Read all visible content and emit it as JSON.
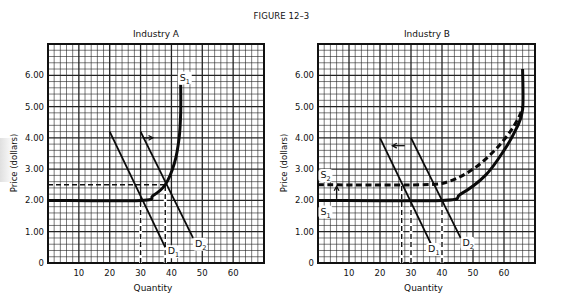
{
  "figure": {
    "title": "FIGURE 12–3"
  },
  "chart_data": [
    {
      "type": "line",
      "title": "Industry A",
      "xlabel": "Quantity",
      "ylabel": "Price (dollars)",
      "xlim": [
        0,
        70
      ],
      "ylim": [
        0,
        7
      ],
      "x_ticks": [
        "10",
        "20",
        "30",
        "40",
        "50",
        "60"
      ],
      "y_ticks": [
        "0",
        "1.00",
        "2.00",
        "3.00",
        "4.00",
        "5.00",
        "6.00"
      ],
      "grid": true,
      "series": [
        {
          "name": "S1",
          "style": "solid-thick",
          "points": [
            [
              0,
              2.0
            ],
            [
              30,
              2.0
            ],
            [
              34,
              2.15
            ],
            [
              38,
              2.5
            ],
            [
              41,
              3.2
            ],
            [
              42.5,
              4.0
            ],
            [
              43,
              4.8
            ],
            [
              43,
              5.7
            ]
          ]
        },
        {
          "name": "D1",
          "style": "solid",
          "points": [
            [
              20,
              4.2
            ],
            [
              38,
              0.5
            ]
          ]
        },
        {
          "name": "D2",
          "style": "solid",
          "points": [
            [
              30,
              4.2
            ],
            [
              47,
              0.8
            ]
          ]
        }
      ],
      "annotations": [
        {
          "type": "dashed-h",
          "y": 2.5,
          "x_from": 0,
          "x_to": 38
        },
        {
          "type": "dashed-v",
          "x": 30,
          "y_from": 0,
          "y_to": 2.0
        },
        {
          "type": "dashed-v",
          "x": 38,
          "y_from": 0,
          "y_to": 2.5
        },
        {
          "type": "arrow",
          "from": [
            31,
            4.0
          ],
          "to": [
            34,
            4.0
          ],
          "direction": "right"
        }
      ],
      "labels": {
        "s1": "S",
        "s1_sub": "1",
        "d1": "D",
        "d1_sub": "1",
        "d2": "D",
        "d2_sub": "2"
      }
    },
    {
      "type": "line",
      "title": "Industry B",
      "xlabel": "Quantity",
      "ylabel": "Price (dollars)",
      "xlim": [
        0,
        70
      ],
      "ylim": [
        0,
        7
      ],
      "x_ticks": [
        "10",
        "20",
        "30",
        "40",
        "50",
        "60"
      ],
      "y_ticks": [
        "0",
        "1.00",
        "2.00",
        "3.00",
        "4.00",
        "5.00",
        "6.00"
      ],
      "grid": true,
      "series": [
        {
          "name": "S1",
          "style": "solid-thick",
          "points": [
            [
              0,
              2.0
            ],
            [
              40,
              2.0
            ],
            [
              46,
              2.2
            ],
            [
              54,
              2.8
            ],
            [
              60,
              3.6
            ],
            [
              64,
              4.3
            ],
            [
              66,
              4.9
            ],
            [
              66,
              6.2
            ]
          ]
        },
        {
          "name": "S2",
          "style": "dashed-thick",
          "points": [
            [
              0,
              2.5
            ],
            [
              33,
              2.5
            ],
            [
              42,
              2.6
            ],
            [
              50,
              3.0
            ],
            [
              57,
              3.6
            ],
            [
              62,
              4.2
            ],
            [
              65,
              4.7
            ],
            [
              66,
              5.0
            ]
          ]
        },
        {
          "name": "D1",
          "style": "solid",
          "points": [
            [
              20,
              4.0
            ],
            [
              37,
              0.5
            ]
          ]
        },
        {
          "name": "D2",
          "style": "solid",
          "points": [
            [
              30,
              4.0
            ],
            [
              46,
              0.8
            ]
          ]
        }
      ],
      "annotations": [
        {
          "type": "dashed-v",
          "x": 27,
          "y_from": 0,
          "y_to": 2.5
        },
        {
          "type": "dashed-v",
          "x": 30,
          "y_from": 0,
          "y_to": 2.0
        },
        {
          "type": "dashed-v",
          "x": 40,
          "y_from": 0,
          "y_to": 2.0
        },
        {
          "type": "arrow",
          "from": [
            28,
            3.75
          ],
          "to": [
            24,
            3.75
          ],
          "direction": "left"
        },
        {
          "type": "arrow",
          "from": [
            6,
            2.05
          ],
          "to": [
            6,
            2.45
          ],
          "direction": "up"
        }
      ],
      "labels": {
        "s1": "S",
        "s1_sub": "1",
        "s2": "S",
        "s2_sub": "2",
        "d1": "D",
        "d1_sub": "1",
        "d2": "D",
        "d2_sub": "2"
      }
    }
  ]
}
